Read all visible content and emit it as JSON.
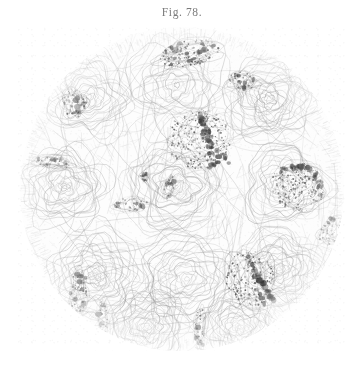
{
  "plate": {
    "background_color": "#ffffff",
    "figure_label": "Fig. 78.",
    "caption": "",
    "caption_visible": false,
    "medium": "engraving",
    "subject": "histological cross-section, circular microscope field"
  },
  "figure": {
    "shape": "circle",
    "center_x": 182,
    "center_y": 189,
    "radius": 162,
    "ink_color": "#6f6f6f",
    "dark_ink_color": "#3a3a3a",
    "stroma_description": "swirling interlaced fibrous connective tissue lines",
    "field_fill": "#fdfdfd"
  },
  "chart_data": {
    "type": "scatter",
    "title": "Fig. 78.",
    "xlabel": "",
    "ylabel": "",
    "legend": [],
    "grid": false,
    "xlim": [
      0,
      330
    ],
    "ylim": [
      0,
      324
    ],
    "annotations": [
      "circular microscope field of fibrous stroma",
      "dark stippled glandular structures scattered within stroma"
    ],
    "series": [
      {
        "name": "glandular-structures",
        "points": [
          {
            "id": "gland-upper-left-round",
            "x": 57,
            "y": 76,
            "w": 22,
            "h": 26,
            "angle": -18,
            "tone": 0.72,
            "shape": "oval"
          },
          {
            "id": "gland-top-lobulated",
            "x": 172,
            "y": 26,
            "w": 56,
            "h": 24,
            "angle": -12,
            "tone": 0.86,
            "shape": "lobulated"
          },
          {
            "id": "gland-top-right-small",
            "x": 226,
            "y": 54,
            "w": 26,
            "h": 16,
            "angle": 8,
            "tone": 0.7,
            "shape": "clustered"
          },
          {
            "id": "gland-center-branching",
            "x": 183,
            "y": 112,
            "w": 60,
            "h": 54,
            "angle": 0,
            "tone": 0.8,
            "shape": "branching"
          },
          {
            "id": "gland-left-mid-band",
            "x": 36,
            "y": 135,
            "w": 34,
            "h": 12,
            "angle": 6,
            "tone": 0.62,
            "shape": "band"
          },
          {
            "id": "gland-mid-left-curl",
            "x": 113,
            "y": 178,
            "w": 32,
            "h": 14,
            "angle": -10,
            "tone": 0.64,
            "shape": "band"
          },
          {
            "id": "gland-right-arc",
            "x": 281,
            "y": 160,
            "w": 50,
            "h": 44,
            "angle": 22,
            "tone": 0.74,
            "shape": "arc"
          },
          {
            "id": "gland-far-right-tail",
            "x": 316,
            "y": 204,
            "w": 20,
            "h": 30,
            "angle": 40,
            "tone": 0.6,
            "shape": "tail"
          },
          {
            "id": "gland-lower-left-vertical",
            "x": 61,
            "y": 268,
            "w": 16,
            "h": 46,
            "angle": 4,
            "tone": 0.78,
            "shape": "vertical"
          },
          {
            "id": "gland-lower-right-star",
            "x": 233,
            "y": 252,
            "w": 44,
            "h": 52,
            "angle": -6,
            "tone": 0.84,
            "shape": "stellate"
          },
          {
            "id": "gland-bottom-right-stem",
            "x": 183,
            "y": 300,
            "w": 10,
            "h": 36,
            "angle": 2,
            "tone": 0.66,
            "shape": "vertical"
          },
          {
            "id": "gland-bottom-left-stem",
            "x": 86,
            "y": 290,
            "w": 9,
            "h": 32,
            "angle": -3,
            "tone": 0.58,
            "shape": "vertical"
          },
          {
            "id": "gland-upper-mid-speck",
            "x": 128,
            "y": 150,
            "w": 6,
            "h": 8,
            "angle": 0,
            "tone": 0.55,
            "shape": "speck"
          },
          {
            "id": "gland-mid-right-speck",
            "x": 152,
            "y": 160,
            "w": 10,
            "h": 22,
            "angle": 14,
            "tone": 0.56,
            "shape": "band"
          }
        ]
      },
      {
        "name": "stromal-lobules",
        "points": [
          {
            "id": "lobule-nw",
            "x": 72,
            "y": 70,
            "r": 44
          },
          {
            "id": "lobule-n",
            "x": 160,
            "y": 58,
            "r": 48
          },
          {
            "id": "lobule-ne",
            "x": 252,
            "y": 72,
            "r": 46
          },
          {
            "id": "lobule-w",
            "x": 48,
            "y": 160,
            "r": 42
          },
          {
            "id": "lobule-c",
            "x": 158,
            "y": 160,
            "r": 52
          },
          {
            "id": "lobule-e",
            "x": 268,
            "y": 158,
            "r": 44
          },
          {
            "id": "lobule-sw",
            "x": 78,
            "y": 248,
            "r": 46
          },
          {
            "id": "lobule-s",
            "x": 170,
            "y": 252,
            "r": 48
          },
          {
            "id": "lobule-se",
            "x": 262,
            "y": 242,
            "r": 44
          },
          {
            "id": "lobule-ss",
            "x": 130,
            "y": 300,
            "r": 40
          },
          {
            "id": "lobule-sse",
            "x": 222,
            "y": 300,
            "r": 38
          }
        ]
      }
    ]
  }
}
